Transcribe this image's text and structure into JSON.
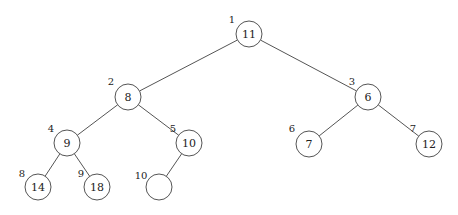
{
  "diagram": {
    "type": "binary-heap-tree",
    "nodes": [
      {
        "index": "1",
        "value": "11",
        "cx": 249,
        "cy": 34,
        "lx": 232,
        "ly": 19
      },
      {
        "index": "2",
        "value": "8",
        "cx": 128,
        "cy": 97,
        "lx": 111,
        "ly": 81
      },
      {
        "index": "3",
        "value": "6",
        "cx": 368,
        "cy": 97,
        "lx": 352,
        "ly": 81
      },
      {
        "index": "4",
        "value": "9",
        "cx": 67,
        "cy": 143,
        "lx": 51,
        "ly": 128
      },
      {
        "index": "5",
        "value": "10",
        "cx": 189,
        "cy": 143,
        "lx": 173,
        "ly": 128
      },
      {
        "index": "6",
        "value": "7",
        "cx": 309,
        "cy": 144,
        "lx": 292,
        "ly": 128
      },
      {
        "index": "7",
        "value": "12",
        "cx": 429,
        "cy": 144,
        "lx": 413,
        "ly": 128
      },
      {
        "index": "8",
        "value": "14",
        "cx": 38,
        "cy": 187,
        "lx": 22,
        "ly": 173
      },
      {
        "index": "9",
        "value": "18",
        "cx": 97,
        "cy": 187,
        "lx": 81,
        "ly": 173
      },
      {
        "index": "10",
        "value": "",
        "cx": 159,
        "cy": 187,
        "lx": 141,
        "ly": 175
      }
    ],
    "edges": [
      [
        0,
        1
      ],
      [
        0,
        2
      ],
      [
        1,
        3
      ],
      [
        1,
        4
      ],
      [
        2,
        5
      ],
      [
        2,
        6
      ],
      [
        3,
        7
      ],
      [
        3,
        8
      ],
      [
        4,
        9
      ]
    ],
    "radius": 13
  }
}
